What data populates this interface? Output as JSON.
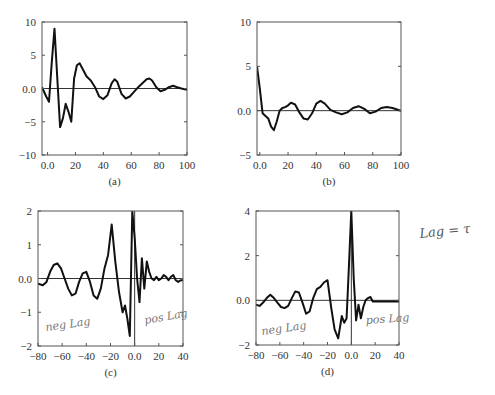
{
  "chart_data": [
    {
      "id": "a",
      "type": "line",
      "caption": "(a)",
      "box": [
        42,
        22,
        187,
        155
      ],
      "xlim": [
        -4,
        100
      ],
      "ylim": [
        -10,
        10
      ],
      "xticks": [
        0,
        20,
        40,
        60,
        80,
        100
      ],
      "xtick_labels": [
        "0.0",
        "20",
        "40",
        "60",
        "80",
        "100"
      ],
      "yticks": [
        -10,
        -5,
        0,
        5,
        10
      ],
      "ytick_labels": [
        "−10",
        "−5",
        "0.0",
        "5",
        "10"
      ],
      "zero_hline": true,
      "zero_vline": false,
      "x": [
        -4,
        -1,
        1,
        3,
        5,
        7,
        9,
        11,
        13,
        15,
        17,
        19,
        21,
        23,
        25,
        28,
        31,
        34,
        37,
        40,
        43,
        46,
        48,
        50,
        53,
        56,
        59,
        62,
        65,
        68,
        71,
        73,
        75,
        78,
        81,
        84,
        87,
        90,
        93,
        96,
        100
      ],
      "values": [
        0.2,
        -1.2,
        -2.0,
        4.0,
        9.0,
        1.5,
        -5.8,
        -4.5,
        -2.3,
        -3.5,
        -5.0,
        1.5,
        3.5,
        3.8,
        3.0,
        1.8,
        1.2,
        0.2,
        -1.2,
        -1.6,
        -1.0,
        0.8,
        1.4,
        1.0,
        -0.8,
        -1.5,
        -1.2,
        -0.5,
        0.2,
        0.8,
        1.4,
        1.5,
        1.2,
        0.2,
        -0.4,
        -0.2,
        0.2,
        0.4,
        0.2,
        0.0,
        -0.2
      ],
      "xlabel": "",
      "ylabel": ""
    },
    {
      "id": "b",
      "type": "line",
      "caption": "(b)",
      "box": [
        257,
        22,
        401,
        155
      ],
      "xlim": [
        -2,
        100
      ],
      "ylim": [
        -5,
        10
      ],
      "xticks": [
        0,
        20,
        40,
        60,
        80,
        100
      ],
      "xtick_labels": [
        "0.0",
        "20",
        "40",
        "60",
        "80",
        "100"
      ],
      "yticks": [
        -5,
        0,
        5,
        10
      ],
      "ytick_labels": [
        "−5",
        "0.0",
        "5",
        "10"
      ],
      "zero_hline": true,
      "zero_vline": false,
      "x": [
        -2,
        0,
        2,
        4,
        6,
        8,
        10,
        12,
        14,
        16,
        18,
        20,
        22,
        25,
        28,
        31,
        34,
        37,
        40,
        43,
        46,
        50,
        54,
        58,
        62,
        66,
        70,
        74,
        78,
        82,
        86,
        90,
        94,
        100
      ],
      "values": [
        5.0,
        2.5,
        -0.3,
        -0.6,
        -0.9,
        -1.8,
        -2.2,
        -1.2,
        0.0,
        0.3,
        0.4,
        0.6,
        0.9,
        0.7,
        -0.2,
        -0.9,
        -1.0,
        -0.3,
        0.8,
        1.1,
        0.8,
        0.1,
        -0.2,
        -0.4,
        -0.2,
        0.3,
        0.5,
        0.2,
        -0.3,
        -0.1,
        0.3,
        0.4,
        0.3,
        0.0
      ],
      "xlabel": "",
      "ylabel": ""
    },
    {
      "id": "c",
      "type": "line",
      "caption": "(c)",
      "box": [
        38,
        211,
        183,
        346
      ],
      "xlim": [
        -80,
        40
      ],
      "ylim": [
        -2,
        2
      ],
      "xticks": [
        -80,
        -60,
        -40,
        -20,
        0,
        20,
        40
      ],
      "xtick_labels": [
        "−80",
        "−60",
        "−40",
        "−20",
        "0.0",
        "20",
        "40"
      ],
      "yticks": [
        -2,
        -1,
        0,
        1,
        2
      ],
      "ytick_labels": [
        "−2",
        "−1",
        "0.0",
        "1",
        "2"
      ],
      "zero_hline": true,
      "zero_vline": true,
      "x": [
        -80,
        -76,
        -73,
        -70,
        -67,
        -64,
        -61,
        -58,
        -55,
        -52,
        -49,
        -46,
        -43,
        -40,
        -37,
        -34,
        -31,
        -28,
        -25,
        -22,
        -19,
        -16,
        -13,
        -10,
        -8,
        -6,
        -4,
        -2,
        0,
        2,
        4,
        6,
        8,
        10,
        12,
        14,
        16,
        18,
        20,
        22,
        24,
        26,
        28,
        30,
        32,
        34,
        36,
        38,
        40
      ],
      "values": [
        -0.15,
        -0.2,
        -0.1,
        0.2,
        0.4,
        0.45,
        0.3,
        0.0,
        -0.3,
        -0.5,
        -0.45,
        -0.1,
        0.15,
        0.2,
        -0.1,
        -0.5,
        -0.6,
        -0.3,
        0.3,
        0.7,
        1.6,
        0.5,
        -0.4,
        -1.0,
        -0.8,
        -1.2,
        -1.7,
        2.0,
        1.2,
        0.0,
        -0.7,
        0.6,
        -0.3,
        0.5,
        0.2,
        0.0,
        -0.05,
        0.05,
        -0.05,
        0.0,
        0.1,
        0.05,
        -0.05,
        0.05,
        0.1,
        -0.05,
        -0.1,
        -0.05,
        -0.05
      ],
      "xlabel": "",
      "ylabel": ""
    },
    {
      "id": "d",
      "type": "line",
      "caption": "(d)",
      "box": [
        256,
        211,
        399,
        345
      ],
      "xlim": [
        -80,
        40
      ],
      "ylim": [
        -2,
        4
      ],
      "xticks": [
        -80,
        -60,
        -40,
        -20,
        0,
        20,
        40
      ],
      "xtick_labels": [
        "−80",
        "−60",
        "−40",
        "−20",
        "0.0",
        "20",
        "40"
      ],
      "yticks": [
        -2,
        0,
        2,
        4
      ],
      "ytick_labels": [
        "−2",
        "0.0",
        "2",
        "4"
      ],
      "zero_hline": true,
      "zero_vline": true,
      "x": [
        -80,
        -77,
        -74,
        -71,
        -68,
        -65,
        -62,
        -59,
        -56,
        -53,
        -50,
        -47,
        -44,
        -41,
        -38,
        -35,
        -32,
        -29,
        -26,
        -23,
        -20,
        -17,
        -14,
        -11,
        -8,
        -6,
        -4,
        -2,
        0,
        2,
        4,
        6,
        8,
        10,
        12,
        14,
        16,
        18,
        20,
        24,
        30,
        40
      ],
      "values": [
        -0.2,
        -0.25,
        -0.1,
        0.1,
        0.25,
        0.1,
        -0.1,
        -0.3,
        -0.35,
        -0.25,
        0.1,
        0.4,
        0.35,
        -0.1,
        -0.6,
        -0.5,
        0.1,
        0.5,
        0.6,
        0.8,
        0.9,
        -0.3,
        -1.3,
        -1.7,
        -0.7,
        -1.0,
        -0.8,
        1.5,
        4.0,
        1.0,
        -0.9,
        -0.2,
        -0.8,
        -0.3,
        0.0,
        0.1,
        0.15,
        -0.05,
        -0.05,
        -0.05,
        -0.05,
        -0.05
      ],
      "xlabel": "",
      "ylabel": ""
    }
  ],
  "annotations": {
    "c_neg": "neg Lag",
    "c_pos": "pos Lag",
    "d_neg": "neg Lag",
    "d_pos": "pos Lag",
    "lag_note": "Lag = τ"
  }
}
